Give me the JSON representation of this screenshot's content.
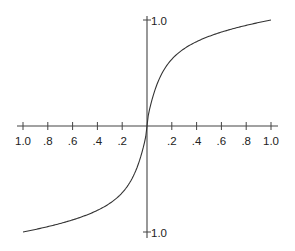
{
  "chart_data": {
    "type": "line",
    "title": "",
    "xlabel": "",
    "ylabel": "",
    "xlim": [
      -1.0,
      1.0
    ],
    "ylim": [
      -1.0,
      1.0
    ],
    "grid": false,
    "legend": null,
    "x_ticks": [
      {
        "value": -1.0,
        "label": "1.0"
      },
      {
        "value": -0.8,
        "label": ".8"
      },
      {
        "value": -0.6,
        "label": ".6"
      },
      {
        "value": -0.4,
        "label": ".4"
      },
      {
        "value": -0.2,
        "label": ".2"
      },
      {
        "value": 0.2,
        "label": ".2"
      },
      {
        "value": 0.4,
        "label": ".4"
      },
      {
        "value": 0.6,
        "label": ".6"
      },
      {
        "value": 0.8,
        "label": ".8"
      },
      {
        "value": 1.0,
        "label": "1.0"
      }
    ],
    "y_ticks": [
      {
        "value": 1.0,
        "label": "1.0"
      },
      {
        "value": -1.0,
        "label": "1.0"
      }
    ],
    "series": [
      {
        "name": "sigmoid-like curve",
        "x": [
          -1.0,
          -0.8,
          -0.6,
          -0.4,
          -0.2,
          -0.1,
          -0.05,
          0,
          0.05,
          0.1,
          0.2,
          0.4,
          0.6,
          0.8,
          1.0
        ],
        "y": [
          -1.0,
          -0.94,
          -0.86,
          -0.74,
          -0.55,
          -0.4,
          -0.28,
          0,
          0.28,
          0.4,
          0.55,
          0.74,
          0.86,
          0.94,
          1.0
        ]
      }
    ]
  }
}
